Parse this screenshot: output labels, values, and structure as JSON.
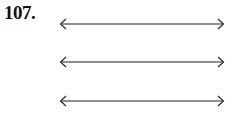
{
  "problem": {
    "number": "107.",
    "lines": [
      {
        "type": "double-arrow-line",
        "y": 24
      },
      {
        "type": "double-arrow-line",
        "y": 62
      },
      {
        "type": "double-arrow-line",
        "y": 101
      }
    ]
  },
  "colors": {
    "ink": "#222222",
    "background": "#ffffff"
  }
}
